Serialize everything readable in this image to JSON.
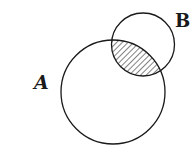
{
  "diagram": {
    "type": "venn",
    "sets": [
      {
        "id": "A",
        "label": "A",
        "cx": 113,
        "cy": 92,
        "r": 52
      },
      {
        "id": "B",
        "label": "B",
        "cx": 143,
        "cy": 44.5,
        "r": 31.5
      }
    ],
    "shaded_region": "A ∩ B",
    "colors": {
      "stroke": "#1a1a1a",
      "background": "#ffffff"
    }
  }
}
